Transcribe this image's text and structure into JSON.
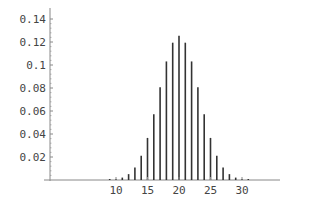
{
  "chart_data": {
    "type": "bar",
    "title": "",
    "xlabel": "",
    "ylabel": "",
    "style": "stem",
    "x": [
      9,
      10,
      11,
      12,
      13,
      14,
      15,
      16,
      17,
      18,
      19,
      20,
      21,
      22,
      23,
      24,
      25,
      26,
      27,
      28,
      29,
      30,
      31
    ],
    "values": [
      0.0002,
      0.0008,
      0.0021,
      0.0051,
      0.0109,
      0.0211,
      0.0366,
      0.0572,
      0.0807,
      0.1031,
      0.1194,
      0.1254,
      0.1194,
      0.1031,
      0.0807,
      0.0572,
      0.0366,
      0.0211,
      0.0109,
      0.0051,
      0.0021,
      0.0008,
      0.0002
    ],
    "xticks": [
      10,
      15,
      20,
      25,
      30
    ],
    "xtick_labels": [
      "10",
      "15",
      "20",
      "25",
      "30"
    ],
    "yticks": [
      0.02,
      0.04,
      0.06,
      0.08,
      0.1,
      0.12,
      0.14
    ],
    "ytick_labels": [
      "0.02",
      "0.04",
      "0.06",
      "0.08",
      "0.1",
      "0.12",
      "0.14"
    ],
    "xlim": [
      0,
      44
    ],
    "ylim": [
      0,
      0.14
    ],
    "grid": false,
    "legend": null,
    "colors": {
      "bar": "#333333",
      "axis": "#888888",
      "text": "#444444"
    }
  }
}
